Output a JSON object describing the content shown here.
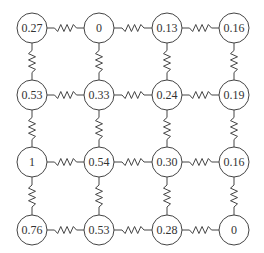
{
  "diagram": {
    "type": "resistor-grid",
    "rows": 4,
    "cols": 4,
    "node_values": [
      [
        "0.27",
        "0",
        "0.13",
        "0.16"
      ],
      [
        "0.53",
        "0.33",
        "0.24",
        "0.19"
      ],
      [
        "1",
        "0.54",
        "0.30",
        "0.16"
      ],
      [
        "0.76",
        "0.53",
        "0.28",
        "0"
      ]
    ],
    "connections": "each node connected by a zigzag spring/resistor to its horizontal and vertical neighbors",
    "colors": {
      "stroke": "#444444",
      "text": "#333333",
      "background": "#ffffff"
    }
  }
}
